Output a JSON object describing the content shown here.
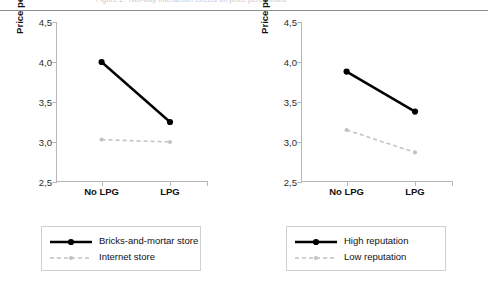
{
  "figure": {
    "clipped_caption": "Figure 2. Two-way interaction effects on price perceptions",
    "axis_color": "#b6b6bb",
    "series_dark_color": "#000000",
    "series_light_color": "#c2c2c8"
  },
  "panels": [
    {
      "id": "left",
      "ylabel": "Price perceptions",
      "yticks": [
        "2,5",
        "3,0",
        "3,5",
        "4,0",
        "4,5"
      ],
      "xticks": [
        "No LPG",
        "LPG"
      ],
      "legend": [
        {
          "label": "Bricks-and-mortar store",
          "style": "solid-marker"
        },
        {
          "label": "Internet store",
          "style": "dashed-marker"
        }
      ]
    },
    {
      "id": "right",
      "ylabel": "Price perceptions",
      "yticks": [
        "2,5",
        "3,0",
        "3,5",
        "4,0",
        "4,5"
      ],
      "xticks": [
        "No LPG",
        "LPG"
      ],
      "legend": [
        {
          "label": "High reputation",
          "style": "solid-marker"
        },
        {
          "label": "Low reputation",
          "style": "dashed-marker"
        }
      ]
    }
  ],
  "chart_data": [
    {
      "type": "line",
      "panel": "left",
      "title": "",
      "xlabel": "",
      "ylabel": "Price perceptions",
      "categories": [
        "No LPG",
        "LPG"
      ],
      "ylim": [
        2.5,
        4.5
      ],
      "ytick_values": [
        2.5,
        3.0,
        3.5,
        4.0,
        4.5
      ],
      "ytick_labels": [
        "2,5",
        "3,0",
        "3,5",
        "4,0",
        "4,5"
      ],
      "grid": false,
      "legend_position": "below",
      "series": [
        {
          "name": "Bricks-and-mortar store",
          "values": [
            4.0,
            3.25
          ],
          "color": "#000000",
          "line": "solid",
          "marker": "circle"
        },
        {
          "name": "Internet store",
          "values": [
            3.03,
            3.0
          ],
          "color": "#c2c2c8",
          "line": "dashed",
          "marker": "circle"
        }
      ]
    },
    {
      "type": "line",
      "panel": "right",
      "title": "",
      "xlabel": "",
      "ylabel": "Price perceptions",
      "categories": [
        "No LPG",
        "LPG"
      ],
      "ylim": [
        2.5,
        4.5
      ],
      "ytick_values": [
        2.5,
        3.0,
        3.5,
        4.0,
        4.5
      ],
      "ytick_labels": [
        "2,5",
        "3,0",
        "3,5",
        "4,0",
        "4,5"
      ],
      "grid": false,
      "legend_position": "below",
      "series": [
        {
          "name": "High reputation",
          "values": [
            3.88,
            3.38
          ],
          "color": "#000000",
          "line": "solid",
          "marker": "circle"
        },
        {
          "name": "Low reputation",
          "values": [
            3.15,
            2.87
          ],
          "color": "#c2c2c8",
          "line": "dashed",
          "marker": "circle"
        }
      ]
    }
  ]
}
